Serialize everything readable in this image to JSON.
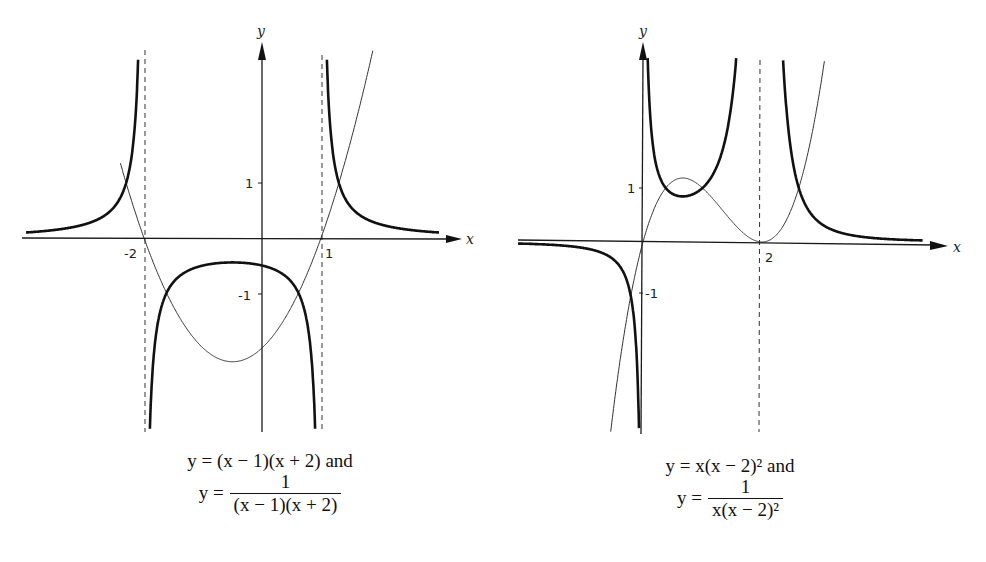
{
  "chart_data": [
    {
      "type": "line",
      "title": "",
      "caption": [
        "y = (x − 1)(x + 2) and",
        "y = 1 / ((x − 1)(x + 2))"
      ],
      "xlabel": "x",
      "ylabel": "y",
      "x_tick_labels": [
        "-2",
        "1"
      ],
      "y_tick_labels": [
        "1",
        "-1"
      ],
      "asymptotes_x": [
        -2,
        1
      ],
      "xlim": [
        -4.1,
        3.3
      ],
      "ylim": [
        -3.5,
        3.9
      ],
      "grid": false,
      "legend": null,
      "series": [
        {
          "name": "y = (x-1)(x+2)",
          "style": "thin",
          "formula": "(x-1)*(x+2)",
          "points": [
            [
              -3,
              4
            ],
            [
              -2,
              0
            ],
            [
              -1,
              -2
            ],
            [
              -0.5,
              -2.25
            ],
            [
              0,
              -2
            ],
            [
              1,
              0
            ],
            [
              2,
              4
            ]
          ]
        },
        {
          "name": "y = 1/((x-1)(x+2))",
          "style": "thick",
          "formula": "1/((x-1)*(x+2))",
          "points": [
            [
              -4,
              0.1
            ],
            [
              -3,
              0.25
            ],
            [
              -2.5,
              0.57
            ],
            [
              -1,
              -0.5
            ],
            [
              -0.5,
              -0.444
            ],
            [
              0,
              -0.5
            ],
            [
              2,
              0.25
            ],
            [
              3,
              0.1
            ]
          ]
        }
      ]
    },
    {
      "type": "line",
      "title": "",
      "caption": [
        "y = x(x − 2)² and",
        "y = 1 / (x(x − 2)²)"
      ],
      "xlabel": "x",
      "ylabel": "y",
      "x_tick_labels": [
        "2"
      ],
      "y_tick_labels": [
        "1",
        "-1"
      ],
      "asymptotes_x": [
        2
      ],
      "xlim": [
        -2.1,
        5.2
      ],
      "ylim": [
        -3.5,
        3.6
      ],
      "grid": false,
      "legend": null,
      "series": [
        {
          "name": "y = x(x-2)^2",
          "style": "thin",
          "formula": "x*(x-2)^2",
          "points": [
            [
              -0.5,
              -3.125
            ],
            [
              0,
              0
            ],
            [
              0.667,
              1.185
            ],
            [
              1,
              1
            ],
            [
              2,
              0
            ],
            [
              3,
              3
            ]
          ]
        },
        {
          "name": "y = 1/(x(x-2)^2)",
          "style": "thick",
          "formula": "1/(x*(x-2)^2)",
          "points": [
            [
              -2,
              -0.03
            ],
            [
              -1,
              -0.111
            ],
            [
              -0.25,
              -1.31
            ],
            [
              0.667,
              0.844
            ],
            [
              1,
              1
            ],
            [
              3,
              0.333
            ],
            [
              4,
              0.0625
            ]
          ]
        }
      ]
    }
  ],
  "left": {
    "axis_x_label": "x",
    "axis_y_label": "y",
    "tick_neg2": "-2",
    "tick_1": "1",
    "ytick_1": "1",
    "ytick_neg1": "-1",
    "caption_line1": "y = (x − 1)(x + 2) and",
    "caption_y": "y =",
    "caption_num": "1",
    "caption_den": "(x − 1)(x + 2)"
  },
  "right": {
    "axis_x_label": "x",
    "axis_y_label": "y",
    "tick_2": "2",
    "ytick_1": "1",
    "ytick_neg1": "-1",
    "caption_line1": "y = x(x − 2)² and",
    "caption_y": "y =",
    "caption_num": "1",
    "caption_den": "x(x − 2)²"
  }
}
